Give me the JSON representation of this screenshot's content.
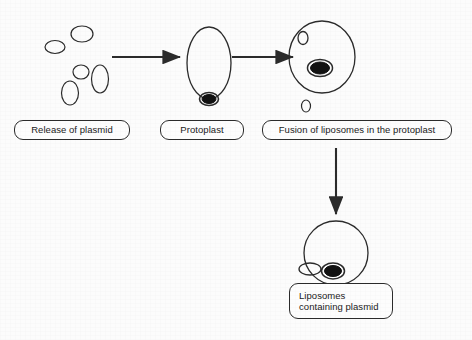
{
  "figure": {
    "background_color": "#fcfcfc",
    "stroke_color": "#2b2b2b",
    "plasmid_fill_color": "#111111"
  },
  "labels": {
    "release": "Release of plasmid",
    "protoplast": "Protoplast",
    "fusion": "Fusion of liposomes in the protoplast",
    "liposomes": "Liposomes\ncontaining plasmid"
  },
  "steps": [
    {
      "id": "step-1",
      "label": "Release of plasmid",
      "description": "Cluster of empty liposome vesicles"
    },
    {
      "id": "step-2",
      "label": "Protoplast",
      "description": "Oval protoplast with plasmid at base"
    },
    {
      "id": "step-3",
      "label": "Fusion of liposomes in the protoplast",
      "description": "Round protoplast containing liposome and plasmid"
    },
    {
      "id": "step-4",
      "label": "Liposomes containing plasmid",
      "description": "Protoplast with attached liposome carrying plasmid"
    }
  ],
  "arrows": [
    {
      "id": "arrow-1",
      "direction": "right",
      "from": "release-of-plasmid",
      "to": "protoplast"
    },
    {
      "id": "arrow-2",
      "direction": "right",
      "from": "protoplast",
      "to": "fusion-of-liposomes"
    },
    {
      "id": "arrow-3",
      "direction": "down",
      "from": "fusion-of-liposomes",
      "to": "liposomes-containing-plasmid"
    }
  ],
  "shapes": {
    "free_liposomes": [
      {
        "cx": 82,
        "cy": 34,
        "rx": 11,
        "ry": 8
      },
      {
        "cx": 55,
        "cy": 47,
        "rx": 10,
        "ry": 6.5
      },
      {
        "cx": 81,
        "cy": 72,
        "rx": 8,
        "ry": 7
      },
      {
        "cx": 100,
        "cy": 79,
        "rx": 8.5,
        "ry": 14
      },
      {
        "cx": 70,
        "cy": 93,
        "rx": 8.5,
        "ry": 12
      },
      {
        "cx": 306,
        "cy": 106,
        "rx": 4.5,
        "ry": 6
      }
    ],
    "protoplast_oval": {
      "cx": 209,
      "cy": 63,
      "rx": 22,
      "ry": 36
    },
    "protoplast_plasmid": {
      "cx": 209,
      "cy": 99,
      "rx": 9,
      "ry": 6
    },
    "fusion_cell": {
      "cx": 322,
      "cy": 57,
      "rx": 33,
      "ry": 36
    },
    "fusion_inner_liposome": {
      "cx": 303,
      "cy": 38,
      "rx": 5,
      "ry": 6
    },
    "fusion_plasmid": {
      "cx": 320,
      "cy": 68,
      "rx": 12,
      "ry": 8
    },
    "final_cell": {
      "cx": 336,
      "cy": 253,
      "rx": 32,
      "ry": 32
    },
    "final_attached_liposome": {
      "cx": 310,
      "cy": 269,
      "rx": 11,
      "ry": 6
    },
    "final_plasmid": {
      "cx": 333,
      "cy": 271,
      "rx": 11,
      "ry": 8
    }
  }
}
